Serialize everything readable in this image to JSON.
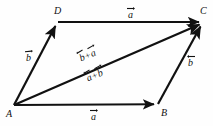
{
  "figure": {
    "type": "vector-parallelogram",
    "background_color": "#fefefe",
    "stroke_color": "#111111",
    "canvas": {
      "width": 213,
      "height": 126
    },
    "vertices": [
      {
        "name": "A",
        "label": "A",
        "x": 14,
        "y": 105,
        "label_x": 6,
        "label_y": 109
      },
      {
        "name": "B",
        "label": "B",
        "x": 158,
        "y": 104,
        "label_x": 161,
        "label_y": 108
      },
      {
        "name": "C",
        "label": "C",
        "x": 203,
        "y": 22,
        "label_x": 200,
        "label_y": 6
      },
      {
        "name": "D",
        "label": "D",
        "x": 58,
        "y": 22,
        "label_x": 54,
        "label_y": 6
      }
    ],
    "edges": [
      {
        "name": "edge-AB",
        "from": "A",
        "to": "B",
        "arrow": "to",
        "label": "a",
        "label_x": 91,
        "label_y": 108
      },
      {
        "name": "edge-DC",
        "from": "D",
        "to": "C",
        "arrow": "to",
        "label": "a",
        "label_x": 128,
        "label_y": 6
      },
      {
        "name": "edge-AD",
        "from": "A",
        "to": "D",
        "arrow": "to",
        "label": "b",
        "label_x": 26,
        "label_y": 49
      },
      {
        "name": "edge-BC",
        "from": "B",
        "to": "C",
        "arrow": "to",
        "label": "b",
        "label_x": 188,
        "label_y": 54
      },
      {
        "name": "diagonal-AC",
        "from": "A",
        "to": "C",
        "arrow": "to",
        "label": "",
        "label_x": 0,
        "label_y": 0
      }
    ],
    "labels": {
      "vector_a": "a",
      "vector_b": "b",
      "plus": "+",
      "sum_above": {
        "first": "b",
        "second": "a",
        "x": 79,
        "y": 45
      },
      "sum_below": {
        "first": "a",
        "second": "b",
        "x": 86,
        "y": 65
      }
    }
  }
}
